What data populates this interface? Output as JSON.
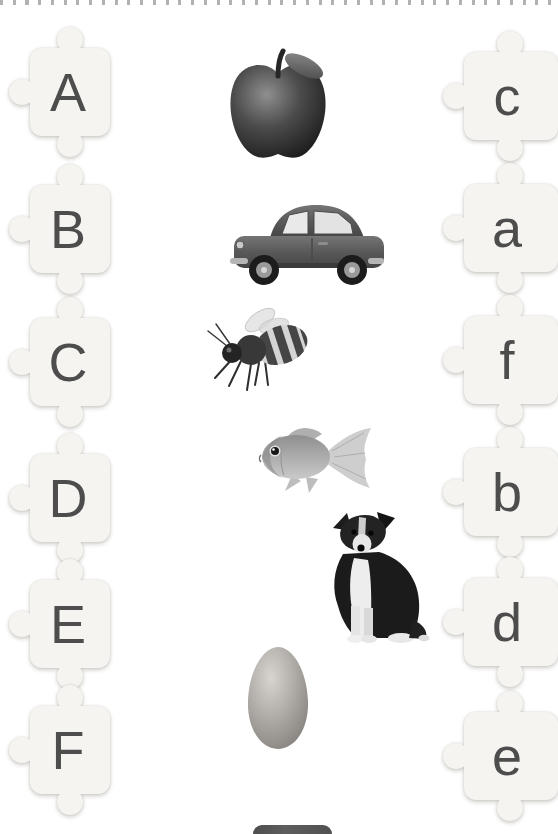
{
  "page": {
    "kind": "alphabet letter matching puzzle worksheet",
    "edge_style": "perforated dotted top edge",
    "left_letters": [
      "A",
      "B",
      "C",
      "D",
      "E",
      "F"
    ],
    "right_letters": [
      "c",
      "a",
      "f",
      "b",
      "d",
      "e"
    ],
    "pictures": [
      "apple",
      "car",
      "bee",
      "fish",
      "dog",
      "egg"
    ],
    "partial_bottom_object": "dark rounded object cut off at bottom edge"
  },
  "colors": {
    "background": "#ffffff",
    "letter": "#4d4d4d",
    "puzzle_piece": "#f5f4f0",
    "perforation_dot": "#9e9e9e"
  }
}
